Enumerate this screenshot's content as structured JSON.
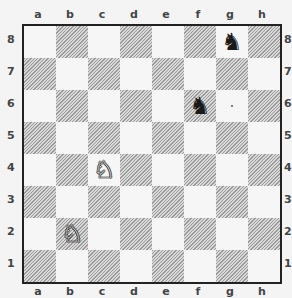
{
  "board": {
    "files": [
      "a",
      "b",
      "c",
      "d",
      "e",
      "f",
      "g",
      "h"
    ],
    "ranks": [
      "8",
      "7",
      "6",
      "5",
      "4",
      "3",
      "2",
      "1"
    ],
    "light_square_color": "#f6f6f6",
    "dark_square_style": "diagonal-hatched grey",
    "pieces": [
      {
        "square": "g8",
        "color": "black",
        "type": "knight",
        "glyph": "♞"
      },
      {
        "square": "f6",
        "color": "black",
        "type": "knight",
        "glyph": "♞"
      },
      {
        "square": "c4",
        "color": "white",
        "type": "knight",
        "glyph": "♘"
      },
      {
        "square": "b2",
        "color": "white",
        "type": "knight",
        "glyph": "♘"
      }
    ]
  }
}
